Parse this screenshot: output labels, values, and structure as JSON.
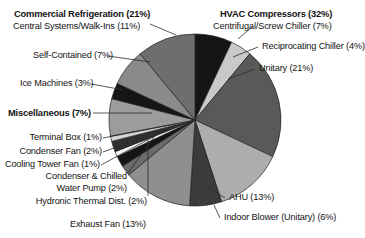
{
  "chart_data": {
    "type": "pie",
    "title": "",
    "total_pct": 100,
    "start_angle_deg": 0,
    "direction": "clockwise",
    "groups": [
      {
        "name": "HVAC Compressors",
        "pct": 32,
        "label": "HVAC Compressors (32%)",
        "bold": true
      },
      {
        "name": "Commercial Refrigeration",
        "pct": 21,
        "label": "Commercial Refrigeration (21%)",
        "bold": true
      },
      {
        "name": "Miscellaneous",
        "pct": 7,
        "label": "Miscellaneous (7%)",
        "bold": true
      }
    ],
    "categories": [
      "Centrifugal/Screw Chiller",
      "Reciprocating Chiller",
      "Unitary",
      "AHU",
      "Indoor Blower (Unitary)",
      "Exhaust Fan",
      "Hydronic Thermal Dist.",
      "Condenser & Chilled Water Pump",
      "Cooling Tower Fan",
      "Condenser Fan",
      "Terminal Box",
      "Miscellaneous",
      "Ice Machines",
      "Self-Contained",
      "Central Systems/Walk-Ins"
    ],
    "values": [
      7,
      4,
      21,
      13,
      6,
      13,
      2,
      2,
      1,
      2,
      1,
      7,
      3,
      7,
      11
    ],
    "colors": [
      "#151515",
      "#c9c9c9",
      "#595959",
      "#adadad",
      "#3b3b3b",
      "#8f8f8f",
      "#6b6b6b",
      "#151515",
      "#f2f2f2",
      "#303030",
      "#d4d4d4",
      "#9c9c9c",
      "#151515",
      "#8a8a8a",
      "#6e6e6e"
    ],
    "slices": [
      {
        "label": "Centrifugal/Screw Chiller (7%)",
        "name": "Centrifugal/Screw Chiller",
        "pct": 7,
        "color": "#151515"
      },
      {
        "label": "Reciprocating Chiller (4%)",
        "name": "Reciprocating Chiller",
        "pct": 4,
        "color": "#c9c9c9"
      },
      {
        "label": "Unitary (21%)",
        "name": "Unitary",
        "pct": 21,
        "color": "#595959"
      },
      {
        "label": "AHU (13%)",
        "name": "AHU",
        "pct": 13,
        "color": "#adadad"
      },
      {
        "label": "Indoor Blower (Unitary) (6%)",
        "name": "Indoor Blower (Unitary)",
        "pct": 6,
        "color": "#3b3b3b"
      },
      {
        "label": "Exhaust Fan (13%)",
        "name": "Exhaust Fan",
        "pct": 13,
        "color": "#8f8f8f"
      },
      {
        "label": "Hydronic Thermal Dist. (2%)",
        "name": "Hydronic Thermal Dist.",
        "pct": 2,
        "color": "#6b6b6b"
      },
      {
        "label": "Condenser & Chilled Water Pump (2%)",
        "name": "Condenser & Chilled Water Pump",
        "pct": 2,
        "color": "#151515"
      },
      {
        "label": "Cooling Tower Fan (1%)",
        "name": "Cooling Tower Fan",
        "pct": 1,
        "color": "#f2f2f2"
      },
      {
        "label": "Condenser Fan (2%)",
        "name": "Condenser Fan",
        "pct": 2,
        "color": "#303030"
      },
      {
        "label": "Terminal Box (1%)",
        "name": "Terminal Box",
        "pct": 1,
        "color": "#d4d4d4"
      },
      {
        "label": "Miscellaneous (7%)",
        "name": "Miscellaneous",
        "pct": 7,
        "color": "#9c9c9c"
      },
      {
        "label": "Ice Machines (3%)",
        "name": "Ice Machines",
        "pct": 3,
        "color": "#151515"
      },
      {
        "label": "Self-Contained (7%)",
        "name": "Self-Contained",
        "pct": 7,
        "color": "#8a8a8a"
      },
      {
        "label": "Central Systems/Walk-Ins (11%)",
        "name": "Central Systems/Walk-Ins",
        "pct": 11,
        "color": "#6e6e6e"
      }
    ],
    "xlabel": "",
    "ylabel": "",
    "legend": "callout-labels"
  },
  "labels": {
    "commercial_refrigeration": "Commercial Refrigeration (21%)",
    "central_systems": "Central Systems/Walk-Ins (11%)",
    "self_contained": "Self-Contained (7%)",
    "ice_machines": "Ice Machines (3%)",
    "miscellaneous": "Miscellaneous (7%)",
    "terminal_box": "Terminal Box (1%)",
    "condenser_fan": "Condenser Fan (2%)",
    "cooling_tower_fan": "Cooling Tower Fan (1%)",
    "condenser_chilled_line1": "Condenser & Chilled",
    "condenser_chilled_line2": "Water Pump (2%)",
    "hydronic": "Hydronic Thermal Dist. (2%)",
    "exhaust_fan": "Exhaust Fan (13%)",
    "hvac_compressors": "HVAC Compressors (32%)",
    "centrifugal": "Centrifugal/Screw Chiller (7%)",
    "reciprocating": "Reciprocating Chiller (4%)",
    "unitary": "Unitary (21%)",
    "ahu": "AHU (13%)",
    "indoor_blower": "Indoor Blower (Unitary) (6%)"
  }
}
